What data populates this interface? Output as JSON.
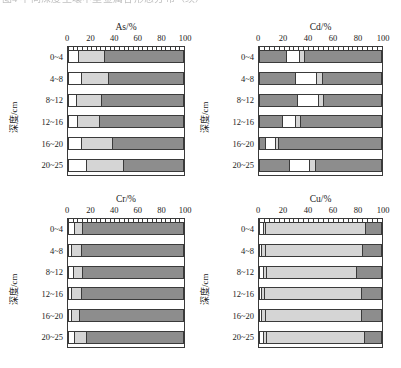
{
  "caption": {
    "top_cut_text": "图4  不同深度土壤中重金属各形态分布（续）"
  },
  "axis": {
    "xticks": [
      0,
      20,
      40,
      60,
      80,
      100
    ],
    "xtick_labels": [
      "0",
      "20",
      "40",
      "60",
      "80",
      "100"
    ],
    "ylabel": "深度/cm",
    "categories": [
      "0~4",
      "4~8",
      "8~12",
      "12~16",
      "16~20",
      "20~25"
    ],
    "xlim": [
      0,
      100
    ],
    "minor_ticks_per_interval": 5
  },
  "colors": {
    "segment_white": "#ffffff",
    "segment_light": "#d5d5d5",
    "segment_dark": "#8d8d8d",
    "outline": "#3a3a3a",
    "text": "#1a1a1a"
  },
  "legend": {
    "present": false
  },
  "panels": [
    {
      "id": "as",
      "title": "As/%"
    },
    {
      "id": "cd",
      "title": "Cd/%"
    },
    {
      "id": "cr",
      "title": "Cr/%"
    },
    {
      "id": "cu",
      "title": "Cu/%"
    }
  ],
  "chart_data": [
    {
      "type": "bar",
      "orientation": "horizontal",
      "stacked": true,
      "title": "As/%",
      "xlabel": "",
      "ylabel": "深度/cm",
      "xlim": [
        0,
        100
      ],
      "grid": false,
      "categories": [
        "0~4",
        "4~8",
        "8~12",
        "12~16",
        "16~20",
        "20~25"
      ],
      "series": [
        {
          "name": "segment-1",
          "color": "#ffffff",
          "values": [
            9,
            11,
            7,
            8,
            11,
            16
          ]
        },
        {
          "name": "segment-2",
          "color": "#d5d5d5",
          "values": [
            23,
            24,
            22,
            19,
            28,
            32
          ]
        },
        {
          "name": "segment-3",
          "color": "#8d8d8d",
          "values": [
            68,
            65,
            71,
            73,
            61,
            52
          ]
        }
      ],
      "cumulative_boundaries": [
        [
          9,
          32
        ],
        [
          11,
          35
        ],
        [
          7,
          29
        ],
        [
          8,
          27
        ],
        [
          11,
          39
        ],
        [
          16,
          48
        ]
      ]
    },
    {
      "type": "bar",
      "orientation": "horizontal",
      "stacked": true,
      "title": "Cd/%",
      "xlabel": "",
      "ylabel": "深度/cm",
      "xlim": [
        0,
        100
      ],
      "grid": false,
      "categories": [
        "0~4",
        "4~8",
        "8~12",
        "12~16",
        "16~20",
        "20~25"
      ],
      "series": [
        {
          "name": "segment-1",
          "color": "#8d8d8d",
          "values": [
            22,
            30,
            31,
            19,
            5,
            25
          ]
        },
        {
          "name": "segment-2",
          "color": "#ffffff",
          "values": [
            11,
            17,
            18,
            11,
            8,
            16
          ]
        },
        {
          "name": "segment-3",
          "color": "#d5d5d5",
          "values": [
            4,
            5,
            4,
            4,
            3,
            5
          ]
        },
        {
          "name": "segment-4",
          "color": "#8d8d8d",
          "values": [
            63,
            48,
            47,
            66,
            84,
            54
          ]
        }
      ],
      "cumulative_boundaries": [
        [
          22,
          33,
          37
        ],
        [
          30,
          47,
          52
        ],
        [
          31,
          49,
          53
        ],
        [
          19,
          30,
          34
        ],
        [
          5,
          13,
          16
        ],
        [
          25,
          41,
          46
        ]
      ]
    },
    {
      "type": "bar",
      "orientation": "horizontal",
      "stacked": true,
      "title": "Cr/%",
      "xlabel": "",
      "ylabel": "深度/cm",
      "xlim": [
        0,
        100
      ],
      "grid": false,
      "categories": [
        "0~4",
        "4~8",
        "8~12",
        "12~16",
        "16~20",
        "20~25"
      ],
      "series": [
        {
          "name": "segment-1",
          "color": "#ffffff",
          "values": [
            5,
            3,
            4,
            3,
            3,
            5
          ]
        },
        {
          "name": "segment-2",
          "color": "#d5d5d5",
          "values": [
            7,
            8,
            8,
            8,
            7,
            11
          ]
        },
        {
          "name": "segment-3",
          "color": "#8d8d8d",
          "values": [
            88,
            89,
            88,
            89,
            90,
            84
          ]
        }
      ],
      "cumulative_boundaries": [
        [
          5,
          12
        ],
        [
          3,
          11
        ],
        [
          4,
          12
        ],
        [
          3,
          11
        ],
        [
          3,
          10
        ],
        [
          5,
          16
        ]
      ]
    },
    {
      "type": "bar",
      "orientation": "horizontal",
      "stacked": true,
      "title": "Cu/%",
      "xlabel": "",
      "ylabel": "深度/cm",
      "xlim": [
        0,
        100
      ],
      "grid": false,
      "categories": [
        "0~4",
        "4~8",
        "8~12",
        "12~16",
        "16~20",
        "20~25"
      ],
      "series": [
        {
          "name": "segment-1",
          "color": "#ffffff",
          "values": [
            3,
            2,
            3,
            2,
            2,
            3
          ]
        },
        {
          "name": "segment-2",
          "color": "#d5d5d5",
          "values": [
            2,
            3,
            3,
            2,
            3,
            3
          ]
        },
        {
          "name": "segment-3",
          "color": "#d5d5d5",
          "values": [
            83,
            80,
            74,
            80,
            79,
            81
          ]
        },
        {
          "name": "segment-4",
          "color": "#8d8d8d",
          "values": [
            12,
            15,
            20,
            16,
            16,
            13
          ]
        }
      ],
      "cumulative_boundaries": [
        [
          3,
          5,
          88
        ],
        [
          2,
          5,
          85
        ],
        [
          3,
          6,
          80
        ],
        [
          2,
          4,
          84
        ],
        [
          2,
          5,
          84
        ],
        [
          3,
          6,
          87
        ]
      ]
    }
  ]
}
